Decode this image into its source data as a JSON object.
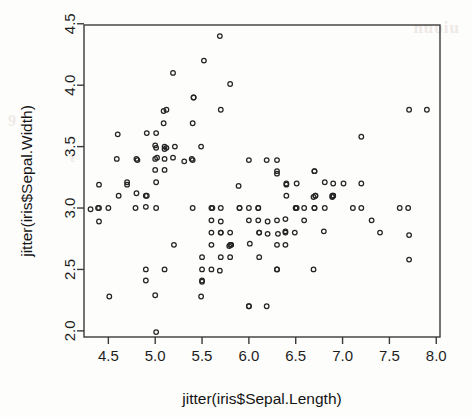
{
  "figure": {
    "background_color": "#fdfdfc",
    "marker_color": "#242424",
    "axis_color": "#3a3a3a",
    "bleed_text_1": "nuoiu",
    "bleed_text_2": "9",
    "bleed_text_3": "t"
  },
  "chart_data": {
    "type": "scatter",
    "title": "",
    "xlabel": "jitter(iris$Sepal.Length)",
    "ylabel": "jitter(iris$Sepal.Width)",
    "xlim": [
      4.24,
      8.04
    ],
    "ylim": [
      1.95,
      4.49
    ],
    "xticks": [
      4.5,
      5.0,
      5.5,
      6.0,
      6.5,
      7.0,
      7.5,
      8.0
    ],
    "xticklabels": [
      "4.5",
      "5.0",
      "5.5",
      "6.0",
      "6.5",
      "7.0",
      "7.5",
      "8.0"
    ],
    "yticks": [
      2.0,
      2.5,
      3.0,
      3.5,
      4.0,
      4.5
    ],
    "yticklabels": [
      "2.0",
      "2.5",
      "3.0",
      "3.5",
      "4.0",
      "4.5"
    ],
    "grid": false,
    "legend": null,
    "marker": "open-circle",
    "marker_size": 2.3,
    "n_points": 150,
    "series": [
      {
        "name": "iris sepal jittered",
        "points": [
          [
            5.1,
            3.5
          ],
          [
            4.9,
            3.01
          ],
          [
            4.7,
            3.21
          ],
          [
            4.61,
            3.1
          ],
          [
            5.01,
            3.61
          ],
          [
            5.41,
            3.9
          ],
          [
            4.59,
            3.4
          ],
          [
            5.02,
            3.41
          ],
          [
            4.4,
            2.89
          ],
          [
            4.91,
            3.1
          ],
          [
            5.4,
            3.69
          ],
          [
            4.81,
            3.39
          ],
          [
            4.79,
            3.0
          ],
          [
            4.31,
            2.99
          ],
          [
            5.8,
            4.01
          ],
          [
            5.69,
            4.4
          ],
          [
            5.41,
            3.9
          ],
          [
            5.1,
            3.48
          ],
          [
            5.7,
            3.8
          ],
          [
            5.12,
            3.8
          ],
          [
            5.4,
            3.39
          ],
          [
            5.09,
            3.69
          ],
          [
            4.6,
            3.6
          ],
          [
            5.1,
            3.31
          ],
          [
            4.8,
            3.4
          ],
          [
            5.01,
            3.0
          ],
          [
            5.0,
            3.4
          ],
          [
            5.21,
            3.5
          ],
          [
            5.19,
            3.41
          ],
          [
            4.7,
            3.19
          ],
          [
            4.8,
            3.12
          ],
          [
            5.39,
            3.4
          ],
          [
            5.19,
            4.1
          ],
          [
            5.52,
            4.2
          ],
          [
            4.9,
            3.1
          ],
          [
            5.01,
            3.21
          ],
          [
            5.49,
            3.5
          ],
          [
            4.91,
            3.61
          ],
          [
            4.39,
            3.0
          ],
          [
            5.1,
            3.4
          ],
          [
            5.0,
            3.51
          ],
          [
            4.51,
            2.28
          ],
          [
            4.4,
            3.19
          ],
          [
            5.01,
            3.49
          ],
          [
            5.09,
            3.79
          ],
          [
            4.4,
            3.0
          ],
          [
            5.12,
            3.49
          ],
          [
            4.5,
            3.0
          ],
          [
            5.31,
            3.38
          ],
          [
            5.0,
            3.31
          ],
          [
            7.01,
            3.2
          ],
          [
            6.4,
            3.19
          ],
          [
            6.89,
            3.09
          ],
          [
            5.49,
            2.28
          ],
          [
            6.49,
            2.8
          ],
          [
            5.7,
            2.8
          ],
          [
            6.3,
            3.28
          ],
          [
            4.9,
            2.41
          ],
          [
            6.59,
            2.9
          ],
          [
            5.2,
            2.7
          ],
          [
            5.01,
            1.99
          ],
          [
            5.9,
            3.0
          ],
          [
            6.0,
            2.2
          ],
          [
            6.1,
            2.9
          ],
          [
            5.6,
            2.9
          ],
          [
            6.71,
            3.1
          ],
          [
            5.61,
            3.0
          ],
          [
            5.81,
            2.7
          ],
          [
            6.19,
            2.2
          ],
          [
            5.6,
            2.5
          ],
          [
            5.89,
            3.18
          ],
          [
            6.11,
            2.8
          ],
          [
            6.3,
            2.5
          ],
          [
            6.11,
            2.8
          ],
          [
            6.39,
            2.91
          ],
          [
            6.59,
            3.0
          ],
          [
            6.8,
            2.81
          ],
          [
            6.7,
            3.0
          ],
          [
            6.0,
            2.9
          ],
          [
            5.7,
            2.6
          ],
          [
            5.5,
            2.41
          ],
          [
            5.5,
            2.4
          ],
          [
            5.81,
            2.7
          ],
          [
            6.01,
            2.71
          ],
          [
            5.4,
            3.0
          ],
          [
            6.0,
            3.39
          ],
          [
            6.69,
            3.09
          ],
          [
            6.89,
            3.1
          ],
          [
            5.6,
            3.0
          ],
          [
            5.5,
            2.5
          ],
          [
            5.5,
            2.6
          ],
          [
            6.1,
            3.0
          ],
          [
            5.8,
            2.6
          ],
          [
            5.0,
            2.29
          ],
          [
            5.6,
            2.7
          ],
          [
            5.7,
            3.0
          ],
          [
            5.7,
            2.89
          ],
          [
            6.2,
            2.89
          ],
          [
            5.1,
            2.5
          ],
          [
            5.7,
            2.8
          ],
          [
            6.3,
            3.3
          ],
          [
            5.79,
            2.69
          ],
          [
            7.11,
            3.0
          ],
          [
            6.3,
            2.9
          ],
          [
            6.51,
            3.0
          ],
          [
            7.61,
            3.0
          ],
          [
            4.9,
            2.5
          ],
          [
            7.31,
            2.9
          ],
          [
            6.69,
            2.5
          ],
          [
            7.2,
            3.58
          ],
          [
            6.51,
            3.2
          ],
          [
            6.39,
            2.7
          ],
          [
            6.81,
            3.0
          ],
          [
            5.69,
            2.49
          ],
          [
            5.8,
            2.8
          ],
          [
            6.4,
            3.2
          ],
          [
            6.5,
            3.0
          ],
          [
            7.71,
            3.8
          ],
          [
            7.71,
            2.58
          ],
          [
            6.0,
            2.2
          ],
          [
            6.9,
            3.2
          ],
          [
            5.6,
            2.8
          ],
          [
            7.71,
            2.78
          ],
          [
            6.3,
            2.7
          ],
          [
            6.7,
            3.3
          ],
          [
            7.2,
            3.2
          ],
          [
            6.2,
            2.79
          ],
          [
            6.1,
            3.0
          ],
          [
            6.39,
            2.8
          ],
          [
            7.2,
            3.0
          ],
          [
            7.4,
            2.8
          ],
          [
            7.9,
            3.8
          ],
          [
            6.39,
            2.81
          ],
          [
            6.31,
            2.79
          ],
          [
            6.11,
            2.6
          ],
          [
            7.7,
            3.0
          ],
          [
            6.3,
            3.39
          ],
          [
            6.4,
            3.1
          ],
          [
            6.0,
            3.0
          ],
          [
            6.9,
            3.1
          ],
          [
            6.71,
            3.1
          ],
          [
            6.9,
            3.1
          ],
          [
            5.8,
            2.7
          ],
          [
            6.81,
            3.21
          ],
          [
            6.7,
            3.3
          ],
          [
            6.7,
            3.0
          ],
          [
            6.3,
            2.5
          ],
          [
            6.5,
            3.0
          ],
          [
            6.19,
            3.39
          ],
          [
            5.9,
            3.0
          ]
        ]
      }
    ]
  }
}
